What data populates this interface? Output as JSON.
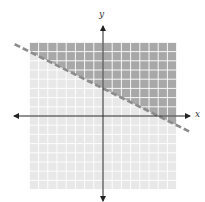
{
  "chart_data": {
    "type": "line",
    "title": "",
    "xlabel": "x",
    "ylabel": "y",
    "xlim": [
      -8,
      8
    ],
    "ylim": [
      -8,
      8
    ],
    "grid": true,
    "grid_step": 1,
    "legend": null,
    "series": [
      {
        "name": "boundary line",
        "equation": "y = -1/2 x + 3",
        "style": "dashed",
        "slope": -0.5,
        "intercept": 3,
        "x": [
          -8,
          8
        ],
        "y": [
          7,
          -1
        ]
      }
    ],
    "shaded_region": {
      "inequality": "y > -1/2 x + 3",
      "side": "above",
      "boundary": "dashed (strict inequality)"
    },
    "annotations": []
  },
  "labels": {
    "x": "x",
    "y": "y"
  },
  "colors": {
    "solution_region": "#a8a8a8",
    "non_solution_region": "#e8e8e8",
    "grid_line": "#ffffff",
    "boundary_line": "#8c8c8c",
    "axis": "#222222"
  }
}
